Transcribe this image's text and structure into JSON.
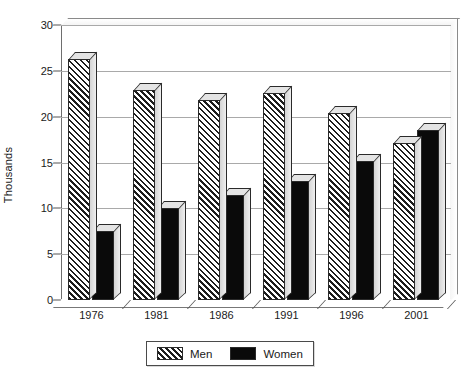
{
  "chart_data": {
    "type": "bar",
    "title": "",
    "xlabel": "",
    "ylabel": "Thousands",
    "categories": [
      "1976",
      "1981",
      "1986",
      "1991",
      "1996",
      "2001"
    ],
    "series": [
      {
        "name": "Men",
        "values": [
          26.3,
          22.9,
          21.8,
          22.6,
          20.4,
          17.1
        ]
      },
      {
        "name": "Women",
        "values": [
          7.5,
          10.0,
          11.5,
          13.0,
          15.2,
          18.5
        ]
      }
    ],
    "ylim": [
      0,
      30
    ],
    "yticks": [
      0,
      5,
      10,
      15,
      20,
      25,
      30
    ],
    "ytick_labels": [
      "0",
      "5",
      "10",
      "15",
      "20",
      "25",
      "30"
    ],
    "grid": true,
    "legend_position": "bottom",
    "legend": [
      "Men",
      "Women"
    ],
    "colors": {
      "men_fill": "#d0d0d0",
      "men_hatch": "#1d1d1d",
      "women_fill": "#0a0a0a",
      "gridline": "#a9a9a9",
      "axis": "#6e6e6e",
      "text": "#1a1a1a",
      "background": "#ffffff"
    }
  }
}
